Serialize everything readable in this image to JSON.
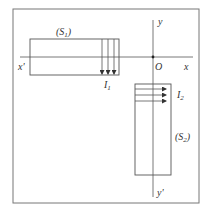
{
  "diagram": {
    "type": "physics-coil-diagram",
    "colors": {
      "line": "#555555",
      "frame": "#777777",
      "text": "#333333"
    },
    "axes": {
      "x_pos_label": "x",
      "x_neg_label": "x'",
      "y_pos_label": "y",
      "y_neg_label": "y'",
      "origin_label": "O"
    },
    "solenoids": [
      {
        "name": "S",
        "sub": "1",
        "current_name": "I",
        "current_sub": "1",
        "orientation": "horizontal",
        "current_direction": "down",
        "turns_shown": 3
      },
      {
        "name": "S",
        "sub": "2",
        "current_name": "I",
        "current_sub": "2",
        "orientation": "vertical",
        "current_direction": "right",
        "turns_shown": 3
      }
    ]
  }
}
